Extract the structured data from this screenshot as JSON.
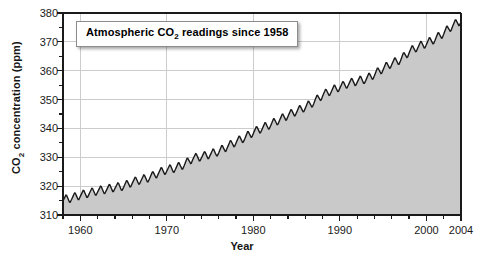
{
  "chart_data": {
    "type": "area",
    "title": "Atmospheric CO2 readings since 1958",
    "title_parts": {
      "pre": "Atmospheric CO",
      "sub": "2",
      "post": " readings since 1958"
    },
    "xlabel": "Year",
    "ylabel": "CO2 concentration (ppm)",
    "ylabel_parts": {
      "pre": "CO",
      "sub": "2",
      "post": " concentration (ppm)"
    },
    "xlim": [
      1958,
      2004
    ],
    "ylim": [
      310,
      380
    ],
    "grid": true,
    "legend": "none",
    "y_ticks": [
      310,
      320,
      330,
      340,
      350,
      360,
      370,
      380
    ],
    "y_minor_step": 5,
    "x_ticks": [
      1960,
      1970,
      1980,
      1990,
      2000,
      2004
    ],
    "x_minor_step": 2,
    "series": [
      {
        "name": "Atmospheric CO2 (Mauna Loa monthly mean)",
        "color": "#1a1a1a",
        "fill_color": "#c9c9c9",
        "annual_mean": {
          "x": [
            1958,
            1959,
            1960,
            1961,
            1962,
            1963,
            1964,
            1965,
            1966,
            1967,
            1968,
            1969,
            1970,
            1971,
            1972,
            1973,
            1974,
            1975,
            1976,
            1977,
            1978,
            1979,
            1980,
            1981,
            1982,
            1983,
            1984,
            1985,
            1986,
            1987,
            1988,
            1989,
            1990,
            1991,
            1992,
            1993,
            1994,
            1995,
            1996,
            1997,
            1998,
            1999,
            2000,
            2001,
            2002,
            2003,
            2004
          ],
          "y": [
            315.3,
            315.9,
            316.9,
            317.6,
            318.4,
            318.9,
            319.6,
            320.0,
            321.4,
            322.2,
            323.0,
            324.6,
            325.7,
            326.3,
            327.5,
            329.7,
            330.2,
            331.1,
            332.0,
            333.8,
            335.4,
            336.8,
            338.7,
            340.1,
            341.4,
            343.0,
            344.6,
            346.0,
            347.4,
            349.2,
            351.6,
            353.1,
            354.4,
            355.6,
            356.4,
            357.1,
            358.8,
            360.8,
            362.6,
            363.8,
            366.6,
            368.3,
            369.5,
            371.0,
            373.1,
            375.6,
            377.4
          ]
        },
        "seasonal_amplitude_ppm": 3.2,
        "min_value": 313.8,
        "max_value": 378.8
      }
    ]
  },
  "axes": {
    "y_tick_labels": [
      "310",
      "320",
      "330",
      "340",
      "350",
      "360",
      "370",
      "380"
    ],
    "x_tick_labels": [
      "1960",
      "1970",
      "1980",
      "1990",
      "2000",
      "2004"
    ]
  }
}
